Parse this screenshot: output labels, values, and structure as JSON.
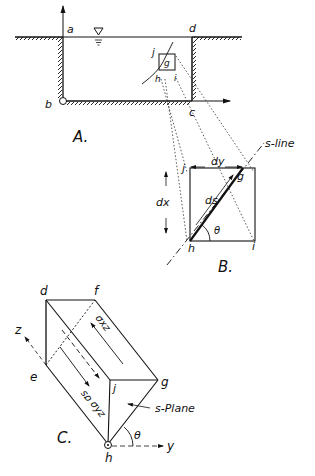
{
  "figure": {
    "panel_a": {
      "caption": "A.",
      "labels": {
        "a": "a",
        "b": "b",
        "c": "c",
        "d": "d",
        "j": "j",
        "g": "g",
        "h": "h",
        "i": "i"
      },
      "water_surface_symbol": "▽"
    },
    "panel_b": {
      "caption": "B.",
      "labels": {
        "j": "j",
        "g": "g",
        "h": "h",
        "i": "i",
        "dx": "dx",
        "dy": "dy",
        "ds": "ds",
        "theta": "θ",
        "s_line": "s-line"
      }
    },
    "panel_c": {
      "caption": "C.",
      "labels": {
        "d": "d",
        "f": "f",
        "e": "e",
        "j": "j",
        "g": "g",
        "h": "h",
        "z": "z",
        "y": "y",
        "theta": "θ",
        "sigma_xz": "σxz",
        "sigma_yz": "σyz",
        "sigma_s": "σs",
        "s_plane": "s-Plane"
      }
    }
  },
  "colors": {
    "ink": "#111111",
    "background": "#ffffff"
  }
}
